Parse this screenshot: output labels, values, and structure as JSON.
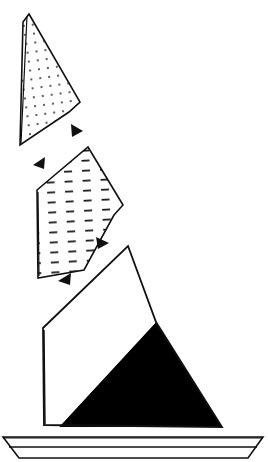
{
  "figure": {
    "canvas": {
      "width": 268,
      "height": 462,
      "background": "#ffffff"
    },
    "stroke_color": "#111111",
    "fill_white": "#ffffff",
    "fill_black": "#000000",
    "shapes": [
      {
        "name": "dotted-wedge",
        "label": "Dotted wedge (upper)",
        "pattern": "dots",
        "stroke_width": 1.6,
        "points": "29,14 80,102 69,112 20,145 23,22",
        "fill": "#ffffff"
      },
      {
        "name": "dashed-wedge",
        "label": "Dashed wedge (middle)",
        "pattern": "dashes",
        "stroke_width": 1.6,
        "points": "88,147 123,205 114,215 84,270 38,278 37,190",
        "fill": "#ffffff"
      },
      {
        "name": "split-wedge",
        "label": "Split black and white wedge (lower)",
        "pattern": "split",
        "stroke_width": 1.8,
        "points": "128,246 156,322 222,427 44,425 43,328",
        "fill": "#ffffff",
        "black_region": "156,322 222,427 59,427"
      },
      {
        "name": "base-platform",
        "label": "Base platform",
        "pattern": "none",
        "stroke_width": 1.6,
        "points": "3,437 263,437 248,458 19,458",
        "fill": "#ffffff"
      },
      {
        "name": "base-platform-inner-line",
        "label": "Base platform inner edge",
        "pattern": "line",
        "stroke_width": 1.4,
        "points": "8,447 258,447"
      }
    ],
    "arrows": [
      {
        "name": "arrow-1",
        "label": "Motion arrow 1 (down-right)",
        "points": "71,124 83,131 72,137",
        "direction": "down-right"
      },
      {
        "name": "arrow-2",
        "label": "Motion arrow 2 (down-left)",
        "points": "45,157 33,165 44,169",
        "direction": "down-left"
      },
      {
        "name": "arrow-3",
        "label": "Motion arrow 3 (down-right)",
        "points": "96,237 109,243 98,249",
        "direction": "down-right"
      },
      {
        "name": "arrow-4",
        "label": "Motion arrow 4 (down-left)",
        "points": "71,273 58,281 70,285",
        "direction": "down-left"
      }
    ],
    "pattern_defs": {
      "dots": {
        "name": "dot-pattern",
        "spacing": 9,
        "dot_radius": 0.9,
        "color": "#111111"
      },
      "dashes": {
        "name": "dash-pattern",
        "row_spacing": 10,
        "dash_length": 8,
        "dash_thickness": 1.6,
        "color": "#111111"
      }
    }
  }
}
